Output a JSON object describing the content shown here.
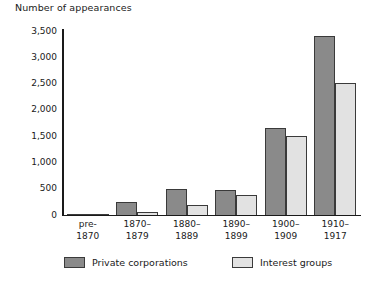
{
  "chart_data": {
    "type": "bar",
    "title": "Number of appearances",
    "xlabel": "",
    "ylabel": "Number of appearances",
    "ylim": [
      0,
      3500
    ],
    "yticks": [
      0,
      500,
      1000,
      1500,
      2000,
      2500,
      3000,
      3500
    ],
    "ytick_labels": [
      "0",
      "500",
      "1,000",
      "1,500",
      "2,000",
      "2,500",
      "3,000",
      "3,500"
    ],
    "grid": false,
    "legend_position": "bottom",
    "categories": [
      "pre-\n1870",
      "1870–\n1879",
      "1880–\n1889",
      "1890–\n1899",
      "1900–\n1909",
      "1910–\n1917"
    ],
    "series": [
      {
        "name": "Private corporations",
        "color": "#8a8a8a",
        "values": [
          20,
          240,
          490,
          480,
          1650,
          3400
        ]
      },
      {
        "name": "Interest groups",
        "color": "#e2e2e2",
        "values": [
          10,
          60,
          200,
          380,
          1500,
          2520
        ]
      }
    ]
  }
}
